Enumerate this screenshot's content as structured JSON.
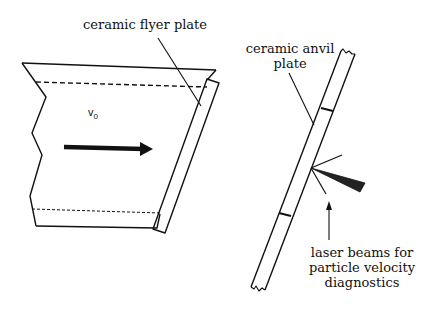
{
  "diagram": {
    "labels": {
      "flyer_plate": "ceramic flyer plate",
      "anvil_plate_line1": "ceramic anvil",
      "anvil_plate_line2": "plate",
      "laser_line1": "laser beams for",
      "laser_line2": "particle velocity",
      "laser_line3": "diagnostics",
      "velocity_symbol": "v",
      "velocity_subscript": "0"
    },
    "colors": {
      "stroke": "#111111",
      "background": "#ffffff",
      "beam_fill": "#222222"
    }
  }
}
